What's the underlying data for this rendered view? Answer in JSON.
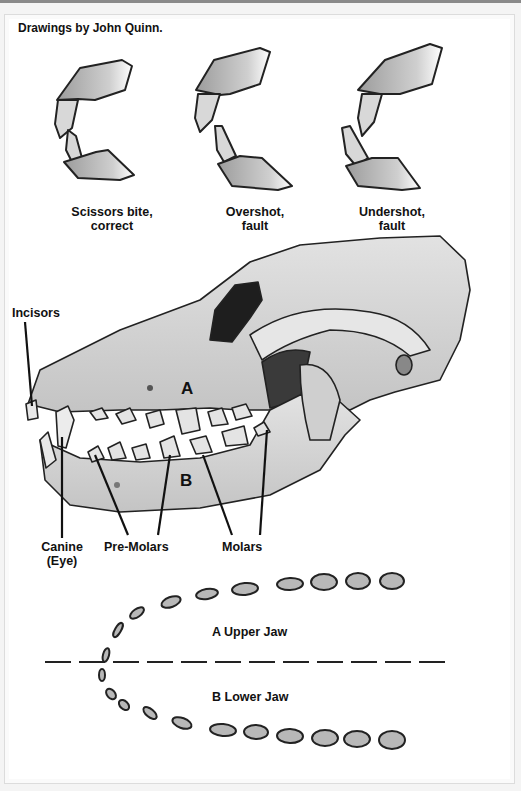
{
  "credit": "Drawings  by John Quinn.",
  "bites": [
    {
      "line1": "Scissors bite,",
      "line2": "correct"
    },
    {
      "line1": "Overshot,",
      "line2": "fault"
    },
    {
      "line1": "Undershot,",
      "line2": "fault"
    }
  ],
  "skull": {
    "region_upper": "A",
    "region_lower": "B",
    "labels": {
      "incisors": "Incisors",
      "canine_1": "Canine",
      "canine_2": "(Eye)",
      "premolars": "Pre-Molars",
      "molars": "Molars"
    }
  },
  "jaw_diagram": {
    "upper": "A Upper Jaw",
    "lower": "B Lower Jaw"
  },
  "colors": {
    "ink": "#111111",
    "bone": "#d9d9d9",
    "shade": "#9a9a9a",
    "frame": "#dcdcdc"
  }
}
